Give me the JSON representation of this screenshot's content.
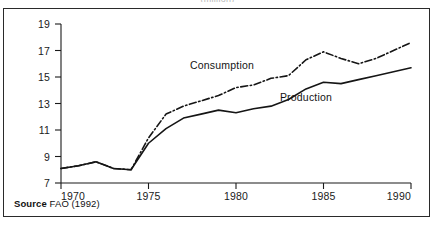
{
  "figure": {
    "clipped_title": "(million)",
    "source_label": "Source",
    "source_value": "FAO (1992)"
  },
  "labels": {
    "consumption": "Consumption",
    "production": "Production"
  },
  "axis": {
    "y_ticks": [
      "7",
      "9",
      "11",
      "13",
      "15",
      "17",
      "19"
    ],
    "x_ticks": [
      "1970",
      "1975",
      "1980",
      "1985",
      "1990"
    ]
  },
  "chart_data": {
    "type": "line",
    "title": "(million)",
    "xlabel": "",
    "ylabel": "",
    "xlim": [
      1970,
      1990
    ],
    "ylim": [
      7,
      19
    ],
    "grid": false,
    "legend": "inline-annotations",
    "x": [
      1970,
      1971,
      1972,
      1973,
      1974,
      1975,
      1976,
      1977,
      1978,
      1979,
      1980,
      1981,
      1982,
      1983,
      1984,
      1985,
      1986,
      1987,
      1988,
      1989,
      1990
    ],
    "series": [
      {
        "name": "Consumption",
        "style": "dash-dot",
        "values": [
          8.1,
          8.3,
          8.6,
          8.1,
          8.0,
          10.4,
          12.2,
          12.8,
          13.2,
          13.6,
          14.2,
          14.4,
          14.9,
          15.1,
          16.3,
          16.9,
          16.4,
          16.0,
          16.4,
          17.0,
          17.6
        ]
      },
      {
        "name": "Production",
        "style": "solid",
        "values": [
          8.1,
          8.3,
          8.6,
          8.1,
          8.0,
          10.0,
          11.1,
          11.9,
          12.2,
          12.5,
          12.3,
          12.6,
          12.8,
          13.3,
          14.1,
          14.6,
          14.5,
          14.8,
          15.1,
          15.4,
          15.7
        ]
      }
    ],
    "y_ticks": [
      7,
      9,
      11,
      13,
      15,
      17,
      19
    ],
    "x_ticks": [
      1970,
      1975,
      1980,
      1985,
      1990
    ],
    "annotations": [
      {
        "text": "Consumption",
        "x": 1979.2,
        "y": 15.6
      },
      {
        "text": "Production",
        "x": 1984.0,
        "y": 13.2
      }
    ]
  }
}
